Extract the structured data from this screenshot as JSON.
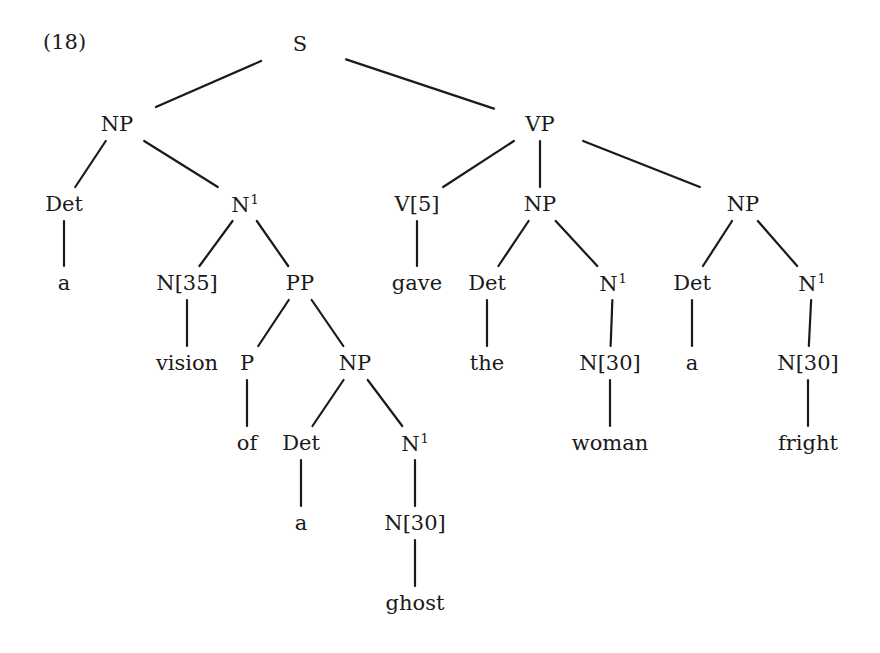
{
  "example": {
    "label": "(18)"
  },
  "tree": {
    "nodes": [
      {
        "id": "s",
        "label": "S",
        "sup": "",
        "x": 300,
        "y": 44
      },
      {
        "id": "np1",
        "label": "NP",
        "sup": "",
        "x": 117,
        "y": 124
      },
      {
        "id": "vp",
        "label": "VP",
        "sup": "",
        "x": 540,
        "y": 124
      },
      {
        "id": "det1",
        "label": "Det",
        "sup": "",
        "x": 64,
        "y": 204
      },
      {
        "id": "nbar1",
        "label": "N",
        "sup": "1",
        "x": 245,
        "y": 204
      },
      {
        "id": "v5",
        "label": "V[5]",
        "sup": "",
        "x": 417,
        "y": 204
      },
      {
        "id": "np2",
        "label": "NP",
        "sup": "",
        "x": 540,
        "y": 204
      },
      {
        "id": "np3",
        "label": "NP",
        "sup": "",
        "x": 743,
        "y": 204
      },
      {
        "id": "a1",
        "label": "a",
        "sup": "",
        "x": 64,
        "y": 283
      },
      {
        "id": "n35",
        "label": "N[35]",
        "sup": "",
        "x": 187,
        "y": 283
      },
      {
        "id": "pp",
        "label": "PP",
        "sup": "",
        "x": 300,
        "y": 283
      },
      {
        "id": "gave",
        "label": "gave",
        "sup": "",
        "x": 417,
        "y": 283
      },
      {
        "id": "det2",
        "label": "Det",
        "sup": "",
        "x": 487,
        "y": 283
      },
      {
        "id": "nbar2",
        "label": "N",
        "sup": "1",
        "x": 613,
        "y": 283
      },
      {
        "id": "det3",
        "label": "Det",
        "sup": "",
        "x": 692,
        "y": 283
      },
      {
        "id": "nbar3",
        "label": "N",
        "sup": "1",
        "x": 812,
        "y": 283
      },
      {
        "id": "vision",
        "label": "vision",
        "sup": "",
        "x": 187,
        "y": 363
      },
      {
        "id": "p",
        "label": "P",
        "sup": "",
        "x": 247,
        "y": 363
      },
      {
        "id": "np4",
        "label": "NP",
        "sup": "",
        "x": 355,
        "y": 363
      },
      {
        "id": "the",
        "label": "the",
        "sup": "",
        "x": 487,
        "y": 363
      },
      {
        "id": "n30a",
        "label": "N[30]",
        "sup": "",
        "x": 610,
        "y": 363
      },
      {
        "id": "a2",
        "label": "a",
        "sup": "",
        "x": 692,
        "y": 363
      },
      {
        "id": "n30b",
        "label": "N[30]",
        "sup": "",
        "x": 808,
        "y": 363
      },
      {
        "id": "of",
        "label": "of",
        "sup": "",
        "x": 247,
        "y": 443
      },
      {
        "id": "det4",
        "label": "Det",
        "sup": "",
        "x": 301,
        "y": 443
      },
      {
        "id": "nbar4",
        "label": "N",
        "sup": "1",
        "x": 415,
        "y": 443
      },
      {
        "id": "woman",
        "label": "woman",
        "sup": "",
        "x": 610,
        "y": 443
      },
      {
        "id": "fright",
        "label": "fright",
        "sup": "",
        "x": 808,
        "y": 443
      },
      {
        "id": "a3",
        "label": "a",
        "sup": "",
        "x": 301,
        "y": 523
      },
      {
        "id": "n30c",
        "label": "N[30]",
        "sup": "",
        "x": 415,
        "y": 523
      },
      {
        "id": "ghost",
        "label": "ghost",
        "sup": "",
        "x": 415,
        "y": 603
      }
    ],
    "edges": [
      [
        "s",
        "np1"
      ],
      [
        "s",
        "vp"
      ],
      [
        "np1",
        "det1"
      ],
      [
        "np1",
        "nbar1"
      ],
      [
        "vp",
        "v5"
      ],
      [
        "vp",
        "np2"
      ],
      [
        "vp",
        "np3"
      ],
      [
        "det1",
        "a1"
      ],
      [
        "nbar1",
        "n35"
      ],
      [
        "nbar1",
        "pp"
      ],
      [
        "v5",
        "gave"
      ],
      [
        "np2",
        "det2"
      ],
      [
        "np2",
        "nbar2"
      ],
      [
        "np3",
        "det3"
      ],
      [
        "np3",
        "nbar3"
      ],
      [
        "n35",
        "vision"
      ],
      [
        "pp",
        "p"
      ],
      [
        "pp",
        "np4"
      ],
      [
        "det2",
        "the"
      ],
      [
        "nbar2",
        "n30a"
      ],
      [
        "det3",
        "a2"
      ],
      [
        "nbar3",
        "n30b"
      ],
      [
        "p",
        "of"
      ],
      [
        "np4",
        "det4"
      ],
      [
        "np4",
        "nbar4"
      ],
      [
        "n30a",
        "woman"
      ],
      [
        "n30b",
        "fright"
      ],
      [
        "det4",
        "a3"
      ],
      [
        "nbar4",
        "n30c"
      ],
      [
        "n30c",
        "ghost"
      ]
    ]
  }
}
